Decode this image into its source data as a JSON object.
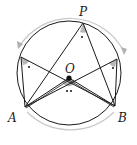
{
  "diagram": {
    "type": "inscribed-angles-circle",
    "labels": {
      "P": "P",
      "O": "O",
      "A": "A",
      "B": "B"
    },
    "points": {
      "center": [
        69,
        73
      ],
      "radius": 52,
      "P": [
        83,
        23
      ],
      "L": [
        21,
        57
      ],
      "R": [
        117,
        59
      ],
      "A": [
        25,
        107
      ],
      "B": [
        115,
        106
      ],
      "O": [
        69,
        78
      ]
    },
    "markers": {
      "inscribed_angle_mark": "•",
      "central_angle_mark": "••"
    },
    "colors": {
      "stroke": "#1a1a1a",
      "angle_fill": "#b8b8b8",
      "arc_guide": "#c8c8c8"
    }
  }
}
